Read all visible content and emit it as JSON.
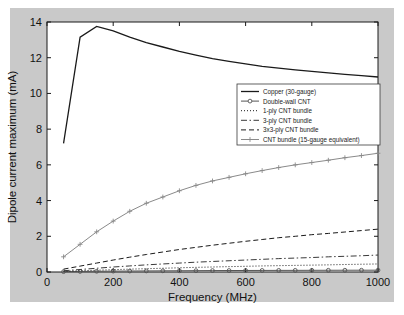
{
  "figure": {
    "background_color": "#c9c9c9",
    "plot_background_color": "#ffffff"
  },
  "chart_data": {
    "type": "line",
    "title": "",
    "xlabel": "Frequency (MHz)",
    "ylabel": "Dipole current maximum (mA)",
    "xlim": [
      0,
      1000
    ],
    "ylim": [
      0,
      14
    ],
    "xticks": [
      0,
      200,
      400,
      600,
      800,
      1000
    ],
    "yticks": [
      0,
      2,
      4,
      6,
      8,
      10,
      12,
      14
    ],
    "xticklabels": [
      "0",
      "200",
      "400",
      "600",
      "800",
      "1000"
    ],
    "yticklabels": [
      "0",
      "2",
      "4",
      "6",
      "8",
      "10",
      "12",
      "14"
    ],
    "grid": false,
    "legend_position": "center-right",
    "x": [
      50,
      100,
      150,
      200,
      250,
      300,
      350,
      400,
      450,
      500,
      550,
      600,
      650,
      700,
      750,
      800,
      850,
      900,
      950,
      1000
    ],
    "series": [
      {
        "name": "Copper (30-gauge)",
        "style": "solid",
        "marker": "none",
        "color": "#1a1a1a",
        "values": [
          7.2,
          13.15,
          13.75,
          13.5,
          13.15,
          12.85,
          12.6,
          12.35,
          12.15,
          11.95,
          11.8,
          11.65,
          11.52,
          11.42,
          11.32,
          11.23,
          11.15,
          11.07,
          11.0,
          10.92
        ]
      },
      {
        "name": "Double-wall CNT",
        "style": "solid",
        "marker": "circle",
        "color": "#555555",
        "values": [
          0.02,
          0.03,
          0.04,
          0.05,
          0.055,
          0.06,
          0.065,
          0.07,
          0.075,
          0.08,
          0.082,
          0.085,
          0.088,
          0.09,
          0.092,
          0.095,
          0.097,
          0.099,
          0.1,
          0.102
        ]
      },
      {
        "name": "1-ply CNT bundle",
        "style": "dotted",
        "marker": "none",
        "color": "#1a1a1a",
        "values": [
          0.04,
          0.07,
          0.1,
          0.13,
          0.16,
          0.185,
          0.21,
          0.235,
          0.26,
          0.28,
          0.3,
          0.32,
          0.34,
          0.355,
          0.37,
          0.385,
          0.4,
          0.42,
          0.435,
          0.45
        ]
      },
      {
        "name": "3-ply CNT bundle",
        "style": "dashdot",
        "marker": "none",
        "color": "#3a3a3a",
        "values": [
          0.07,
          0.14,
          0.21,
          0.28,
          0.34,
          0.4,
          0.45,
          0.5,
          0.55,
          0.59,
          0.63,
          0.67,
          0.71,
          0.75,
          0.78,
          0.81,
          0.85,
          0.88,
          0.91,
          0.95
        ]
      },
      {
        "name": "3x3-ply CNT bundle",
        "style": "dashed",
        "marker": "none",
        "color": "#1a1a1a",
        "values": [
          0.16,
          0.33,
          0.5,
          0.67,
          0.83,
          0.98,
          1.12,
          1.26,
          1.38,
          1.5,
          1.61,
          1.72,
          1.82,
          1.92,
          2.0,
          2.09,
          2.16,
          2.24,
          2.32,
          2.4
        ]
      },
      {
        "name": "CNT bundle (15-gauge equivalent)",
        "style": "solid",
        "marker": "plus",
        "color": "#8a8a8a",
        "values": [
          0.85,
          1.55,
          2.25,
          2.85,
          3.4,
          3.85,
          4.2,
          4.55,
          4.85,
          5.1,
          5.3,
          5.5,
          5.68,
          5.85,
          6.0,
          6.13,
          6.26,
          6.4,
          6.52,
          6.65
        ]
      }
    ]
  },
  "legend": {
    "entries": [
      {
        "label": "Copper (30-gauge)"
      },
      {
        "label": "Double-wall CNT"
      },
      {
        "label": "1-ply CNT bundle"
      },
      {
        "label": "3-ply CNT bundle"
      },
      {
        "label": "3x3-ply CNT bundle"
      },
      {
        "label": "CNT bundle (15-gauge equivalent)"
      }
    ]
  }
}
